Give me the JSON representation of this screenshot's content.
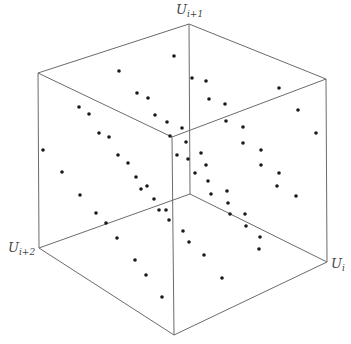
{
  "figure": {
    "axes": [
      {
        "id": "x",
        "base": "U",
        "sub": "i",
        "label": "U_i"
      },
      {
        "id": "y",
        "base": "U",
        "sub": "i+1",
        "label": "U_{i+1}"
      },
      {
        "id": "z",
        "base": "U",
        "sub": "i+2",
        "label": "U_{i+2}"
      }
    ],
    "colors": {
      "edge": "#6b6b6b",
      "dot": "#1a1a1a",
      "background": "#ffffff",
      "label": "#444444"
    },
    "cube_vertices": {
      "top_back": [
        189,
        24
      ],
      "top_left": [
        38,
        73
      ],
      "top_right": [
        326,
        79
      ],
      "top_front": [
        172,
        137
      ],
      "bottom_back": [
        190,
        194
      ],
      "bottom_left": [
        39,
        248
      ],
      "bottom_right": [
        327,
        262
      ],
      "bottom_front": [
        174,
        335
      ]
    },
    "points_screen": [
      [
        174,
        56
      ],
      [
        119,
        71
      ],
      [
        192,
        78
      ],
      [
        206,
        81
      ],
      [
        279,
        88
      ],
      [
        137,
        93
      ],
      [
        148,
        98
      ],
      [
        209,
        99
      ],
      [
        225,
        104
      ],
      [
        79,
        107
      ],
      [
        89,
        114
      ],
      [
        155,
        115
      ],
      [
        167,
        122
      ],
      [
        226,
        121
      ],
      [
        182,
        128
      ],
      [
        243,
        127
      ],
      [
        298,
        110
      ],
      [
        99,
        133
      ],
      [
        109,
        137
      ],
      [
        170,
        136
      ],
      [
        316,
        133
      ],
      [
        186,
        142
      ],
      [
        243,
        143
      ],
      [
        43,
        150
      ],
      [
        118,
        155
      ],
      [
        177,
        155
      ],
      [
        201,
        153
      ],
      [
        128,
        163
      ],
      [
        188,
        159
      ],
      [
        206,
        165
      ],
      [
        261,
        150
      ],
      [
        261,
        165
      ],
      [
        62,
        172
      ],
      [
        136,
        177
      ],
      [
        195,
        173
      ],
      [
        279,
        173
      ],
      [
        141,
        189
      ],
      [
        147,
        186
      ],
      [
        208,
        181
      ],
      [
        277,
        186
      ],
      [
        80,
        195
      ],
      [
        154,
        199
      ],
      [
        211,
        194
      ],
      [
        227,
        191
      ],
      [
        296,
        196
      ],
      [
        159,
        210
      ],
      [
        166,
        210
      ],
      [
        228,
        203
      ],
      [
        96,
        213
      ],
      [
        230,
        214
      ],
      [
        245,
        214
      ],
      [
        106,
        223
      ],
      [
        169,
        220
      ],
      [
        246,
        226
      ],
      [
        183,
        231
      ],
      [
        117,
        238
      ],
      [
        189,
        242
      ],
      [
        260,
        237
      ],
      [
        259,
        249
      ],
      [
        204,
        255
      ],
      [
        135,
        260
      ],
      [
        146,
        275
      ],
      [
        222,
        278
      ],
      [
        162,
        297
      ]
    ]
  }
}
